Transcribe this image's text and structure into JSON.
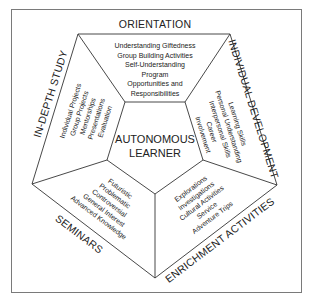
{
  "diagram": {
    "center": {
      "line1": "AUTONOMOUS",
      "line2": "LEARNER"
    },
    "sections": [
      {
        "title": "ORIENTATION",
        "items": [
          "Understanding Giftedness",
          "Group Building Activities",
          "Self-Understanding",
          "Program",
          "Opportunities and",
          "Responsibilities"
        ]
      },
      {
        "title": "INDIVIDUAL DEVELOPMENT",
        "items": [
          "Learning Skills",
          "Personal Understanding",
          "Interpersonal Skills",
          "Career",
          "Involvement"
        ]
      },
      {
        "title": "ENRICHMENT ACTIVITIES",
        "items": [
          "Explorations",
          "Investigations",
          "Cultural Activities",
          "Service",
          "Adventure Trips"
        ]
      },
      {
        "title": "SEMINARS",
        "items": [
          "Futuristic",
          "Problematic",
          "Controversial",
          "General Interest",
          "Advanced Knowledge"
        ]
      },
      {
        "title": "IN-DEPTH STUDY",
        "items": [
          "Individual Projects",
          "Group Projects",
          "Mentorships",
          "Presentations",
          "Evaluation"
        ]
      }
    ],
    "colors": {
      "line": "#333333",
      "text": "#222222",
      "frame": "#7a7a7a",
      "background": "#ffffff"
    }
  }
}
